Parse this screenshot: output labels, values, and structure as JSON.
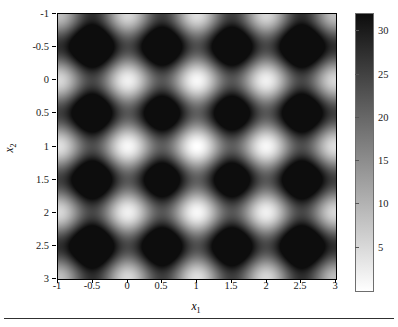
{
  "figure": {
    "background_color": "#ffffff",
    "axis_color": "#000000",
    "bottom_rule": ""
  },
  "axes": {
    "xlabel": "x",
    "xlabel_sub": "1",
    "ylabel": "x",
    "ylabel_sub": "2",
    "xticks": [
      "-1",
      "-0.5",
      "0",
      "0.5",
      "1",
      "1.5",
      "2",
      "2.5",
      "3"
    ],
    "yticks": [
      "3",
      "2.5",
      "2",
      "1.5",
      "1",
      "0.5",
      "0",
      "-0.5",
      "-1"
    ]
  },
  "colorbar": {
    "ticks": [
      "30",
      "25",
      "20",
      "15",
      "10",
      "5"
    ],
    "low_color": "#ffffff",
    "high_color": "#0d0d0d"
  },
  "chart_data": {
    "type": "heatmap",
    "title": "",
    "xlabel": "x1",
    "ylabel": "x2",
    "colormap": "gray-reversed",
    "grid": false,
    "legend": "colorbar-right",
    "xlim": [
      -1,
      3
    ],
    "ylim": [
      -1,
      3
    ],
    "clim": [
      0,
      32
    ],
    "xtick_values": [
      -1,
      -0.5,
      0,
      0.5,
      1,
      1.5,
      2,
      2.5,
      3
    ],
    "ytick_values": [
      -1,
      -0.5,
      0,
      0.5,
      1,
      1.5,
      2,
      2.5,
      3
    ],
    "colorbar_tick_values": [
      5,
      10,
      15,
      20,
      25,
      30
    ],
    "function": "Rastrigin (shifted): f(x1,x2) = 20 + sum_i [ (xi-1)^2 - 10*cos(2*pi*(xi-1)) ]",
    "global_minimum": {
      "x1": 1,
      "x2": 1,
      "value": 0
    },
    "sampled_values": {
      "note": "f evaluated on a coarse grid over the plotted domain",
      "x": [
        -1,
        -0.5,
        0,
        0.5,
        1,
        1.5,
        2,
        2.5,
        3
      ],
      "y": [
        3,
        2.5,
        2,
        1.5,
        1,
        0.5,
        0,
        -0.5,
        -1
      ],
      "z": [
        [
          24,
          29,
          24,
          29,
          24,
          29,
          24,
          29,
          24
        ],
        [
          29,
          34,
          29,
          34,
          29,
          34,
          29,
          34,
          29
        ],
        [
          24,
          29,
          24,
          29,
          24,
          29,
          24,
          29,
          24
        ],
        [
          29,
          34,
          29,
          34,
          29,
          34,
          29,
          34,
          29
        ],
        [
          24,
          29,
          24,
          29,
          24,
          29,
          24,
          29,
          24
        ],
        [
          29,
          34,
          29,
          34,
          29,
          34,
          29,
          34,
          29
        ],
        [
          24,
          29,
          24,
          29,
          24,
          29,
          24,
          29,
          24
        ],
        [
          29,
          34,
          29,
          34,
          29,
          34,
          29,
          34,
          29
        ],
        [
          24,
          29,
          24,
          29,
          24,
          29,
          24,
          29,
          24
        ]
      ]
    }
  }
}
